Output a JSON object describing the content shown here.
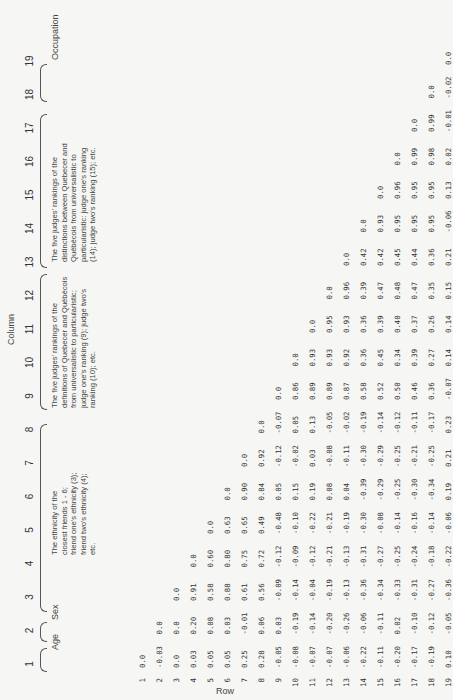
{
  "header": {
    "column_word": "Column",
    "row_word": "Row",
    "column_numbers": [
      "1",
      "2",
      "3",
      "4",
      "5",
      "6",
      "7",
      "8",
      "9",
      "10",
      "11",
      "12",
      "13",
      "14",
      "15",
      "16",
      "17",
      "18",
      "19"
    ]
  },
  "groups": [
    {
      "columns": "1",
      "label": "Age"
    },
    {
      "columns": "2",
      "label": "Sex"
    },
    {
      "columns": "3-8",
      "label_lines": [
        "The ethnicity of the",
        "closest friends 1 - 6;",
        "friend one's ethnicity (3);",
        "friend two's ethnicity (4);",
        "etc."
      ]
    },
    {
      "columns": "9-13",
      "label_lines": [
        "The five judges' rankings of the",
        "definitions of Quebecer and Québécois",
        "from universalistic to particularistic;",
        "judge one's ranking (9); judge two's",
        "ranking (10); etc."
      ]
    },
    {
      "columns": "14-18",
      "label_lines": [
        "The five judges' rankings of the",
        "distinctions between Quebecer and",
        "Québécois from universalistic to",
        "particularistic: judge one's ranking",
        "(14); judge two's ranking (15); etc."
      ]
    },
    {
      "columns": "19",
      "label": "Occupation"
    }
  ],
  "row_labels": [
    "1",
    "2",
    "3",
    "4",
    "5",
    "6",
    "7",
    "8",
    "9",
    "10",
    "11",
    "12",
    "13",
    "14",
    "15",
    "16",
    "17",
    "18",
    "19"
  ],
  "chart_data": {
    "type": "table",
    "xlabel": "Column",
    "ylabel": "Row",
    "variables": [
      "Age",
      "Sex",
      "Friend 1 ethnicity",
      "Friend 2 ethnicity",
      "Friend 3 ethnicity",
      "Friend 4 ethnicity",
      "Friend 5 ethnicity",
      "Friend 6 ethnicity",
      "Judge 1 definition ranking",
      "Judge 2 definition ranking",
      "Judge 3 definition ranking",
      "Judge 4 definition ranking",
      "Judge 5 definition ranking",
      "Judge 1 distinction ranking",
      "Judge 2 distinction ranking",
      "Judge 3 distinction ranking",
      "Judge 4 distinction ranking",
      "Judge 5 distinction ranking",
      "Occupation"
    ],
    "rows": [
      [
        "0.0"
      ],
      [
        "-0.03",
        "0.0"
      ],
      [
        "0.0",
        "0.0",
        "0.0"
      ],
      [
        "0.03",
        "0.20",
        "0.91",
        "0.0"
      ],
      [
        "0.05",
        "0.08",
        "0.58",
        "0.60",
        "0.0"
      ],
      [
        "0.05",
        "0.03",
        "0.88",
        "0.80",
        "0.63",
        "0.0"
      ],
      [
        "0.25",
        "-0.01",
        "0.61",
        "0.75",
        "0.65",
        "0.90",
        "0.0"
      ],
      [
        "0.28",
        "0.06",
        "0.56",
        "0.72",
        "0.49",
        "0.84",
        "0.92",
        "0.0"
      ],
      [
        "-0.05",
        "0.03",
        "-0.09",
        "-0.12",
        "-0.48",
        "0.05",
        "-0.12",
        "-0.07",
        "0.0"
      ],
      [
        "-0.08",
        "-0.19",
        "-0.14",
        "-0.09",
        "-0.10",
        "0.15",
        "-0.02",
        "0.05",
        "0.86",
        "0.0"
      ],
      [
        "-0.07",
        "-0.14",
        "-0.04",
        "-0.12",
        "-0.22",
        "0.19",
        "0.03",
        "0.13",
        "0.89",
        "0.93",
        "0.0"
      ],
      [
        "-0.07",
        "-0.20",
        "-0.19",
        "-0.21",
        "-0.21",
        "0.08",
        "-0.08",
        "-0.05",
        "0.89",
        "0.93",
        "0.95",
        "0.0"
      ],
      [
        "-0.06",
        "-0.26",
        "-0.13",
        "-0.13",
        "-0.19",
        "0.04",
        "-0.11",
        "-0.02",
        "0.87",
        "0.92",
        "0.93",
        "0.96",
        "0.0"
      ],
      [
        "-0.22",
        "-0.06",
        "-0.36",
        "-0.31",
        "-0.30",
        "-0.39",
        "-0.30",
        "-0.19",
        "0.58",
        "0.36",
        "0.36",
        "0.39",
        "0.42",
        "0.0"
      ],
      [
        "-0.11",
        "-0.11",
        "-0.34",
        "-0.27",
        "-0.08",
        "-0.29",
        "-0.29",
        "-0.14",
        "0.52",
        "0.45",
        "0.39",
        "0.47",
        "0.42",
        "0.93",
        "0.0"
      ],
      [
        "-0.20",
        "0.02",
        "-0.33",
        "-0.25",
        "-0.14",
        "-0.25",
        "-0.25",
        "-0.12",
        "0.50",
        "0.34",
        "0.40",
        "0.48",
        "0.45",
        "0.95",
        "0.96",
        "0.0"
      ],
      [
        "-0.17",
        "-0.10",
        "-0.31",
        "-0.24",
        "-0.16",
        "-0.30",
        "-0.21",
        "-0.11",
        "0.46",
        "0.39",
        "0.37",
        "0.47",
        "0.44",
        "0.95",
        "0.95",
        "0.99",
        "0.0"
      ],
      [
        "-0.19",
        "-0.12",
        "-0.27",
        "-0.18",
        "-0.14",
        "-0.34",
        "-0.25",
        "-0.17",
        "0.36",
        "0.27",
        "0.26",
        "0.35",
        "0.36",
        "0.95",
        "0.95",
        "0.98",
        "0.99",
        "0.0"
      ],
      [
        "0.10",
        "-0.05",
        "-0.36",
        "-0.22",
        "-0.06",
        "0.19",
        "0.21",
        "0.23",
        "-0.07",
        "0.14",
        "0.14",
        "0.15",
        "0.21",
        "-0.06",
        "0.13",
        "0.02",
        "-0.01",
        "-0.02",
        "0.0"
      ]
    ]
  }
}
